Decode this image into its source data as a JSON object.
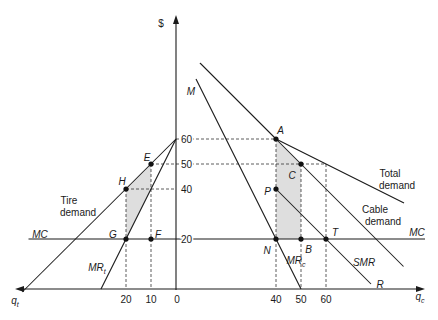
{
  "chart_data": {
    "type": "line",
    "title": "",
    "ylabel": "$",
    "xlabel_left": {
      "text": "q",
      "sub": "t"
    },
    "xlabel_right": {
      "text": "q",
      "sub": "c"
    },
    "note": "Back-to-back diagram: tire quantity q_t increases to the left of the price axis, cable quantity q_c increases to the right. x < 0 denotes q_t, x > 0 denotes q_c.",
    "xlim": [
      -63.6,
      98.8
    ],
    "ylim": [
      0,
      108.4
    ],
    "grid": false,
    "y_ticks": [
      {
        "value": 60,
        "label": "60"
      },
      {
        "value": 50,
        "label": "50"
      },
      {
        "value": 40,
        "label": "40"
      },
      {
        "value": 20,
        "label": "20"
      }
    ],
    "x_ticks": [
      {
        "value": -20,
        "label": "20"
      },
      {
        "value": -10,
        "label": "10"
      },
      {
        "value": 0,
        "label": "0"
      },
      {
        "value": 40,
        "label": "40"
      },
      {
        "value": 50,
        "label": "50"
      },
      {
        "value": 60,
        "label": "60"
      }
    ],
    "series": [
      {
        "name": "Total demand",
        "id": "total-demand-upper",
        "points": [
          [
            9.6,
            90.4
          ],
          [
            40,
            60
          ]
        ]
      },
      {
        "name": "Total demand",
        "id": "total-demand-lower",
        "points": [
          [
            40,
            60
          ],
          [
            91.2,
            34.4
          ]
        ]
      },
      {
        "name": "Cable demand",
        "id": "cable-demand",
        "points": [
          [
            9.6,
            90.4
          ],
          [
            91,
            9
          ]
        ]
      },
      {
        "name": "MR_c (M)",
        "id": "mr-cable",
        "points": [
          [
            8,
            84
          ],
          [
            50,
            0
          ]
        ]
      },
      {
        "name": "SMR",
        "id": "smr",
        "points": [
          [
            40,
            40
          ],
          [
            78,
            2
          ]
        ]
      },
      {
        "name": "Tire demand",
        "id": "tire-demand",
        "points": [
          [
            0,
            60
          ],
          [
            -61.5,
            -1.2
          ]
        ]
      },
      {
        "name": "MR_t",
        "id": "mr-tire",
        "points": [
          [
            0,
            60
          ],
          [
            -30,
            0
          ]
        ]
      },
      {
        "name": "MC",
        "id": "mc",
        "points": [
          [
            -59,
            20
          ],
          [
            99.6,
            20
          ]
        ]
      }
    ],
    "points": [
      {
        "label": "A",
        "x": 40,
        "y": 60
      },
      {
        "label": "C",
        "x": 50,
        "y": 50
      },
      {
        "label": "P",
        "x": 40,
        "y": 40
      },
      {
        "label": "N",
        "x": 40,
        "y": 20
      },
      {
        "label": "B",
        "x": 50,
        "y": 20
      },
      {
        "label": "T",
        "x": 60,
        "y": 20
      },
      {
        "label": "E",
        "x": -10,
        "y": 50
      },
      {
        "label": "H",
        "x": -20,
        "y": 40
      },
      {
        "label": "G",
        "x": -20,
        "y": 20
      },
      {
        "label": "F",
        "x": -10,
        "y": 20
      }
    ],
    "guides": [
      {
        "id": "h60",
        "points": [
          [
            0,
            60
          ],
          [
            40,
            60
          ]
        ]
      },
      {
        "id": "h50",
        "points": [
          [
            -10,
            50
          ],
          [
            60,
            50
          ]
        ]
      },
      {
        "id": "h40",
        "points": [
          [
            -20,
            40
          ],
          [
            0,
            40
          ]
        ]
      },
      {
        "id": "v-t20",
        "points": [
          [
            -20,
            40
          ],
          [
            -20,
            0
          ]
        ]
      },
      {
        "id": "v-t10",
        "points": [
          [
            -10,
            50
          ],
          [
            -10,
            0
          ]
        ]
      },
      {
        "id": "v-c40",
        "points": [
          [
            40,
            60
          ],
          [
            40,
            0
          ]
        ]
      },
      {
        "id": "v-c50",
        "points": [
          [
            50,
            50
          ],
          [
            50,
            0
          ]
        ]
      },
      {
        "id": "v-c60",
        "points": [
          [
            60,
            50
          ],
          [
            60,
            0
          ]
        ]
      }
    ],
    "shaded_regions": [
      {
        "id": "tire-shaded-area",
        "points": [
          [
            -20,
            40
          ],
          [
            -10,
            50
          ],
          [
            -10,
            40.4
          ],
          [
            -20,
            20
          ]
        ]
      },
      {
        "id": "cable-shaded-area",
        "points": [
          [
            40,
            60
          ],
          [
            50,
            50
          ],
          [
            50,
            20
          ],
          [
            40,
            20
          ]
        ]
      }
    ],
    "annotations": [
      {
        "text": "M",
        "x": 6,
        "y": 79.2,
        "italic": true,
        "anchor": "middle"
      },
      {
        "text": "A",
        "x": 41.8,
        "y": 63.4,
        "italic": true,
        "anchor": "middle"
      },
      {
        "text": "C",
        "x": 46.4,
        "y": 45.6,
        "italic": true,
        "anchor": "middle"
      },
      {
        "text": "P",
        "x": 36.6,
        "y": 39.2,
        "italic": true,
        "anchor": "middle"
      },
      {
        "text": "N",
        "x": 36.4,
        "y": 15.6,
        "italic": true,
        "anchor": "middle"
      },
      {
        "text": "B",
        "x": 53,
        "y": 16,
        "italic": true,
        "anchor": "middle"
      },
      {
        "text": "T",
        "x": 63.6,
        "y": 22.6,
        "italic": true,
        "anchor": "middle"
      },
      {
        "text": "MR",
        "sub": "c",
        "x": 48,
        "y": 11.6,
        "italic": true,
        "anchor": "middle"
      },
      {
        "text": "SMR",
        "x": 75.2,
        "y": 10.8,
        "italic": true,
        "anchor": "middle"
      },
      {
        "text": "R",
        "x": 81.6,
        "y": 2,
        "italic": true,
        "anchor": "middle"
      },
      {
        "text": "MC",
        "x": 96.4,
        "y": 22.6,
        "italic": true,
        "anchor": "middle"
      },
      {
        "text": "Total",
        "x": 85.6,
        "y": 46.4,
        "italic": false,
        "anchor": "middle"
      },
      {
        "text": "demand",
        "x": 88.4,
        "y": 41.4,
        "italic": false,
        "anchor": "middle"
      },
      {
        "text": "Cable",
        "x": 79.6,
        "y": 32,
        "italic": false,
        "anchor": "middle"
      },
      {
        "text": "demand",
        "x": 82.8,
        "y": 27.2,
        "italic": false,
        "anchor": "middle"
      },
      {
        "text": "E",
        "x": -11.6,
        "y": 52.6,
        "italic": true,
        "anchor": "middle"
      },
      {
        "text": "H",
        "x": -21.6,
        "y": 43.2,
        "italic": true,
        "anchor": "middle"
      },
      {
        "text": "Tire",
        "x": -42.8,
        "y": 35.6,
        "italic": false,
        "anchor": "middle"
      },
      {
        "text": "demand",
        "x": -39.2,
        "y": 30.6,
        "italic": false,
        "anchor": "middle"
      },
      {
        "text": "MC",
        "x": -54.4,
        "y": 22,
        "italic": true,
        "anchor": "middle"
      },
      {
        "text": "G",
        "x": -25.2,
        "y": 22,
        "italic": true,
        "anchor": "middle"
      },
      {
        "text": "F",
        "x": -7.2,
        "y": 22,
        "italic": true,
        "anchor": "middle"
      },
      {
        "text": "MR",
        "sub": "t",
        "x": -31.6,
        "y": 8.8,
        "italic": true,
        "anchor": "middle"
      }
    ]
  }
}
